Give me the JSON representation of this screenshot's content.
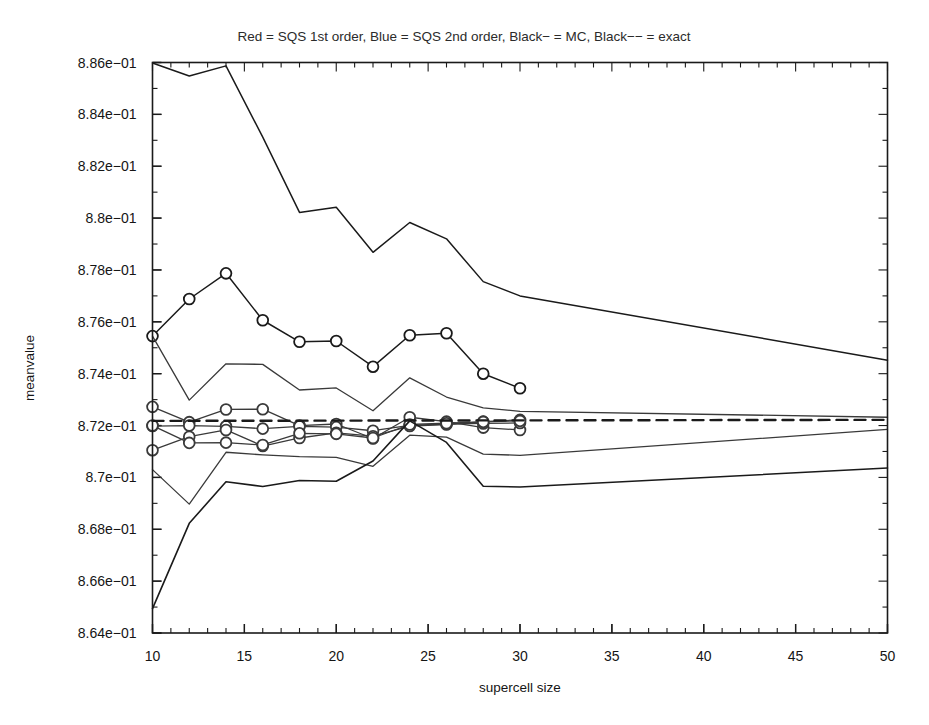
{
  "chart_data": {
    "type": "line",
    "title": "Red = SQS 1st order, Blue = SQS 2nd order, Black− = MC, Black−− = exact",
    "xlabel": "supercell size",
    "ylabel": "meanvalue",
    "xlim": [
      10,
      50
    ],
    "ylim": [
      0.864,
      0.886
    ],
    "grid": false,
    "legend_position": "title",
    "xticks": [
      10,
      15,
      20,
      25,
      30,
      35,
      40,
      45,
      50
    ],
    "xticklabels": [
      "10",
      "15",
      "20",
      "25",
      "30",
      "35",
      "40",
      "45",
      "50"
    ],
    "yticks": [
      0.864,
      0.866,
      0.868,
      0.87,
      0.872,
      0.874,
      0.876,
      0.878,
      0.88,
      0.882,
      0.884,
      0.886
    ],
    "yticklabels": [
      "8.64e−01",
      "8.66e−01",
      "8.68e−01",
      "8.7e−01",
      "8.72e−01",
      "8.74e−01",
      "8.76e−01",
      "8.78e−01",
      "8.8e−01",
      "8.82e−01",
      "8.84e−01",
      "8.86e−01"
    ],
    "xtick_minor_step": 1,
    "ytick_minor_step": 0.001,
    "series": [
      {
        "name": "MC upper branch",
        "style": "solid",
        "color": "#1a1a1a",
        "width": 1.5,
        "markers": false,
        "x": [
          10,
          12,
          14,
          16,
          18,
          20,
          22,
          24,
          26,
          28,
          30,
          50
        ],
        "values": [
          0.88598,
          0.88548,
          0.88587,
          0.88312,
          0.88022,
          0.88042,
          0.87868,
          0.87983,
          0.8792,
          0.87755,
          0.877,
          0.87452
        ]
      },
      {
        "name": "SQS 1st order",
        "style": "solid",
        "color": "#1a1a1a",
        "width": 1.5,
        "markers": true,
        "x": [
          10,
          12,
          14,
          16,
          18,
          20,
          22,
          24,
          26,
          28,
          30
        ],
        "values": [
          0.87545,
          0.87688,
          0.87787,
          0.87606,
          0.87523,
          0.87526,
          0.87427,
          0.87548,
          0.87556,
          0.874,
          0.87344
        ]
      },
      {
        "name": "SQS 2nd order A",
        "style": "solid",
        "color": "#3a3a3a",
        "width": 1.3,
        "markers": true,
        "x": [
          10,
          12,
          14,
          16,
          18,
          20,
          22,
          24,
          26,
          28,
          30
        ],
        "values": [
          0.87272,
          0.87213,
          0.87262,
          0.87263,
          0.872,
          0.87206,
          0.8715,
          0.87232,
          0.87215,
          0.87192,
          0.87183
        ]
      },
      {
        "name": "SQS 2nd order B",
        "style": "solid",
        "color": "#3a3a3a",
        "width": 1.3,
        "markers": true,
        "x": [
          10,
          12,
          14,
          16,
          18,
          20,
          22,
          24,
          26,
          28,
          30
        ],
        "values": [
          0.87198,
          0.872,
          0.87197,
          0.87188,
          0.87197,
          0.87194,
          0.8718,
          0.87201,
          0.87206,
          0.87208,
          0.8721
        ]
      },
      {
        "name": "SQS 2nd order C",
        "style": "solid",
        "color": "#3a3a3a",
        "width": 1.3,
        "markers": true,
        "x": [
          10,
          12,
          14,
          16,
          18,
          20,
          22,
          24,
          26,
          28,
          30
        ],
        "values": [
          0.87105,
          0.87157,
          0.87183,
          0.87121,
          0.87152,
          0.87172,
          0.87159,
          0.87198,
          0.87204,
          0.87215,
          0.87222
        ]
      },
      {
        "name": "SQS 2nd order D",
        "style": "solid",
        "color": "#3a3a3a",
        "width": 1.3,
        "markers": true,
        "x": [
          10,
          12,
          14,
          16,
          18,
          20,
          22,
          24,
          26,
          28,
          30
        ],
        "values": [
          0.872,
          0.87133,
          0.87134,
          0.87125,
          0.8717,
          0.87168,
          0.87152,
          0.87204,
          0.87209,
          0.87214,
          0.87218
        ]
      },
      {
        "name": "SQS upper envelope",
        "style": "solid",
        "color": "#3a3a3a",
        "width": 1.3,
        "markers": false,
        "x": [
          10,
          12,
          14,
          16,
          18,
          20,
          22,
          24,
          26,
          28,
          30,
          50
        ],
        "values": [
          0.87545,
          0.87298,
          0.87438,
          0.87436,
          0.87337,
          0.87345,
          0.87257,
          0.87384,
          0.8731,
          0.87268,
          0.87255,
          0.87232
        ]
      },
      {
        "name": "SQS lower envelope",
        "style": "solid",
        "color": "#3a3a3a",
        "width": 1.3,
        "markers": false,
        "x": [
          10,
          12,
          14,
          16,
          18,
          20,
          22,
          24,
          26,
          28,
          30,
          50
        ],
        "values": [
          0.8703,
          0.86897,
          0.87097,
          0.87087,
          0.8708,
          0.87077,
          0.87043,
          0.87163,
          0.87155,
          0.8709,
          0.87085,
          0.87185
        ]
      },
      {
        "name": "exact",
        "style": "dashed",
        "color": "#1a1a1a",
        "width": 2.4,
        "markers": false,
        "x": [
          10,
          50
        ],
        "values": [
          0.87218,
          0.87222
        ]
      },
      {
        "name": "MC lower branch",
        "style": "solid",
        "color": "#1a1a1a",
        "width": 1.6,
        "markers": false,
        "x": [
          10,
          12,
          14,
          16,
          18,
          20,
          22,
          24,
          26,
          28,
          30,
          50
        ],
        "values": [
          0.86494,
          0.86823,
          0.86983,
          0.86965,
          0.86988,
          0.86985,
          0.87063,
          0.87218,
          0.87135,
          0.86966,
          0.86963,
          0.87036
        ]
      }
    ]
  }
}
